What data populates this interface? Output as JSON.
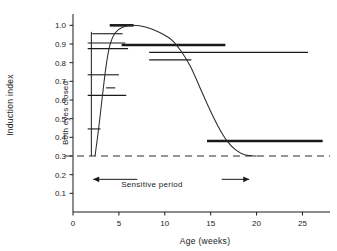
{
  "chart_data": {
    "type": "line",
    "title": "",
    "xlabel": "Age (weeks)",
    "ylabel": "Induction index",
    "xlim": [
      0,
      28
    ],
    "ylim": [
      0,
      1.05
    ],
    "xticks": [
      0,
      5,
      10,
      15,
      20,
      25
    ],
    "xticklabels": [
      "0",
      "5",
      "10",
      "15",
      "20",
      "25"
    ],
    "yticks": [
      0.1,
      0.2,
      0.3,
      0.4,
      0.5,
      0.6,
      0.7,
      0.8,
      0.9,
      1.0
    ],
    "yticklabels": [
      "0.1",
      "0.2",
      "0.3",
      "0.4",
      "0.5",
      "0.6",
      "0.7",
      "0.8",
      "0.9",
      "1.0"
    ],
    "grid": false,
    "legend": "none",
    "baseline": {
      "value": 0.3,
      "style": "dashed",
      "label": ""
    },
    "curve": {
      "name": "sensitive period response curve",
      "shape": "sigmoid rise then fall",
      "points": [
        [
          2.4,
          0.3
        ],
        [
          2.8,
          0.45
        ],
        [
          3.2,
          0.62
        ],
        [
          3.6,
          0.78
        ],
        [
          4.0,
          0.89
        ],
        [
          4.6,
          0.96
        ],
        [
          5.4,
          0.99
        ],
        [
          6.5,
          1.0
        ],
        [
          8.0,
          0.99
        ],
        [
          9.5,
          0.96
        ],
        [
          10.8,
          0.92
        ],
        [
          11.8,
          0.86
        ],
        [
          12.8,
          0.78
        ],
        [
          13.8,
          0.67
        ],
        [
          14.8,
          0.56
        ],
        [
          15.8,
          0.46
        ],
        [
          16.8,
          0.38
        ],
        [
          17.8,
          0.33
        ],
        [
          18.8,
          0.305
        ],
        [
          20.0,
          0.3
        ]
      ]
    },
    "bars": [
      {
        "y": 1.0,
        "x_start": 4.0,
        "x_end": 6.6,
        "weight": "thick"
      },
      {
        "y": 0.955,
        "x_start": 2.1,
        "x_end": 5.4,
        "weight": "thin"
      },
      {
        "y": 0.905,
        "x_start": 1.6,
        "x_end": 5.7,
        "weight": "thin"
      },
      {
        "y": 0.895,
        "x_start": 5.3,
        "x_end": 16.6,
        "weight": "thick"
      },
      {
        "y": 0.875,
        "x_start": 1.6,
        "x_end": 6.0,
        "weight": "thin"
      },
      {
        "y": 0.855,
        "x_start": 8.3,
        "x_end": 25.6,
        "weight": "thin"
      },
      {
        "y": 0.815,
        "x_start": 8.3,
        "x_end": 12.9,
        "weight": "thin"
      },
      {
        "y": 0.735,
        "x_start": 1.6,
        "x_end": 5.0,
        "weight": "thin"
      },
      {
        "y": 0.665,
        "x_start": 3.6,
        "x_end": 4.6,
        "weight": "thin"
      },
      {
        "y": 0.625,
        "x_start": 1.6,
        "x_end": 5.8,
        "weight": "thin"
      },
      {
        "y": 0.445,
        "x_start": 1.6,
        "x_end": 3.0,
        "weight": "thin"
      },
      {
        "y": 0.38,
        "x_start": 14.6,
        "x_end": 27.2,
        "weight": "thick"
      }
    ],
    "annotations": [
      {
        "name": "both-eyes-closed",
        "text": "Both eyes closed",
        "orientation": "vertical"
      },
      {
        "name": "sensitive-period",
        "text": "Sensitive period",
        "orientation": "horizontal",
        "arrow": "double",
        "x_start": 2.2,
        "x_end": 19.2,
        "y": 0.175
      }
    ],
    "colors": {
      "axis": "#1a1a1a",
      "curve": "#2b2b2b",
      "bar": "#1a1a1a",
      "baseline": "#2b2b2b",
      "background": "#ffffff"
    }
  }
}
